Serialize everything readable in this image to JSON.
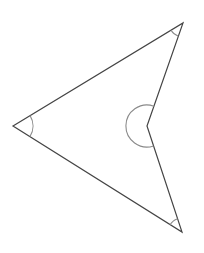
{
  "diagram": {
    "type": "concave-quadrilateral",
    "vertices": [
      {
        "id": "left",
        "x": 13,
        "y": 126
      },
      {
        "id": "top-right",
        "x": 183,
        "y": 23
      },
      {
        "id": "reflex",
        "x": 147,
        "y": 126
      },
      {
        "id": "bottom-right",
        "x": 182,
        "y": 232
      }
    ],
    "angle_marks": [
      {
        "vertex": "left",
        "radius": 20,
        "kind": "acute"
      },
      {
        "vertex": "top-right",
        "radius": 14,
        "kind": "acute"
      },
      {
        "vertex": "reflex",
        "radius": 21,
        "kind": "reflex"
      },
      {
        "vertex": "bottom-right",
        "radius": 14,
        "kind": "acute"
      }
    ],
    "colors": {
      "edge": "#444444",
      "arc": "#8a8a8a",
      "background": "#ffffff"
    }
  }
}
